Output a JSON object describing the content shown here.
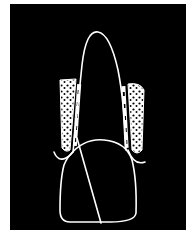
{
  "figure": {
    "background_color": "#000000",
    "line_color": "#ffffff",
    "page_color": "#ffffff",
    "parts": [
      {
        "name": "root",
        "description": "tall rounded root outline"
      },
      {
        "name": "crown",
        "description": "dome-shaped crown outline"
      },
      {
        "name": "alveolar-bone-left",
        "description": "stippled bone region left of root"
      },
      {
        "name": "alveolar-bone-right",
        "description": "stippled bone region right of root"
      },
      {
        "name": "periodontal-ligament-left",
        "description": "dashed ligament strip left"
      },
      {
        "name": "periodontal-ligament-right",
        "description": "dashed ligament strip right"
      },
      {
        "name": "gingiva-left",
        "description": "curved gum line left"
      },
      {
        "name": "gingiva-right",
        "description": "curved gum line right"
      },
      {
        "name": "diagonal-line",
        "description": "oblique line through crown"
      }
    ]
  }
}
